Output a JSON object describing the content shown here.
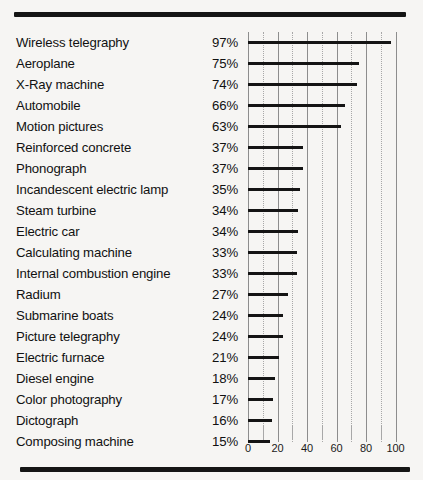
{
  "chart_data": {
    "type": "bar",
    "orientation": "horizontal",
    "title": "",
    "subtitle": "",
    "xlabel": "",
    "ylabel": "",
    "xlim": [
      0,
      103
    ],
    "xticks": [
      0,
      20,
      40,
      60,
      80,
      100
    ],
    "xtick_labels": [
      "0",
      "20",
      "40",
      "60",
      "80",
      "100"
    ],
    "minor_xticks": [
      10,
      30,
      50,
      70,
      90
    ],
    "grid": "vertical solid at major ticks, dotted at minor ticks",
    "legend": "none",
    "value_label_suffix": "%",
    "categories": [
      "Wireless telegraphy",
      "Aeroplane",
      "X-Ray machine",
      "Automobile",
      "Motion pictures",
      "Reinforced concrete",
      "Phonograph",
      "Incandescent electric lamp",
      "Steam turbine",
      "Electric car",
      "Calculating machine",
      "Internal combustion engine",
      "Radium",
      "Submarine boats",
      "Picture telegraphy",
      "Electric furnace",
      "Diesel engine",
      "Color photography",
      "Dictograph",
      "Composing machine"
    ],
    "values": [
      97,
      75,
      74,
      66,
      63,
      37,
      37,
      35,
      34,
      34,
      33,
      33,
      27,
      24,
      24,
      21,
      18,
      17,
      16,
      15
    ],
    "value_labels": [
      "97%",
      "75%",
      "74%",
      "66%",
      "63%",
      "37%",
      "37%",
      "35%",
      "34%",
      "34%",
      "33%",
      "33%",
      "27%",
      "24%",
      "24%",
      "21%",
      "18%",
      "17%",
      "16%",
      "15%"
    ],
    "colors": {
      "bar": "#141414",
      "background": "#f6f5f3",
      "text": "#111111",
      "gridline_major": "#8d8d8d",
      "gridline_minor": "#a8a8a8",
      "rule": "#151515"
    }
  },
  "decorations": {
    "top_rule": "",
    "bottom_rule": ""
  }
}
